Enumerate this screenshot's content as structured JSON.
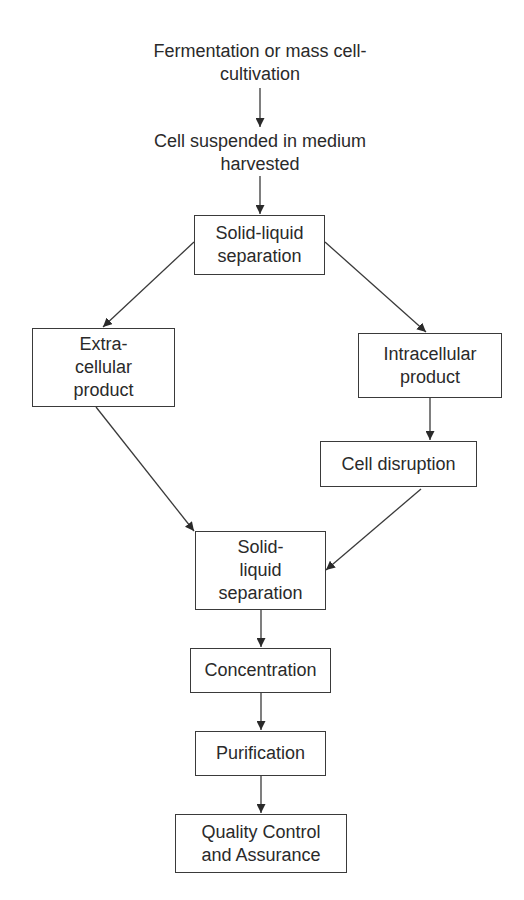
{
  "diagram": {
    "type": "flowchart",
    "nodes": {
      "fermentation": {
        "lines": [
          "Fermentation or mass cell-",
          "cultivation"
        ],
        "shape": "text"
      },
      "harvested": {
        "lines": [
          "Cell suspended in medium",
          "harvested"
        ],
        "shape": "text"
      },
      "sls1": {
        "lines": [
          "Solid-liquid",
          "separation"
        ],
        "shape": "box"
      },
      "extracellular": {
        "lines": [
          "Extra-",
          "cellular",
          "product"
        ],
        "shape": "box"
      },
      "intracellular": {
        "lines": [
          "Intracellular",
          "product"
        ],
        "shape": "box"
      },
      "disruption": {
        "lines": [
          "Cell disruption"
        ],
        "shape": "box"
      },
      "sls2": {
        "lines": [
          "Solid-",
          "liquid",
          "separation"
        ],
        "shape": "box"
      },
      "concentration": {
        "lines": [
          "Concentration"
        ],
        "shape": "box"
      },
      "purification": {
        "lines": [
          "Purification"
        ],
        "shape": "box"
      },
      "qc": {
        "lines": [
          "Quality Control",
          "and Assurance"
        ],
        "shape": "box"
      }
    },
    "edges": [
      {
        "from": "fermentation",
        "to": "harvested"
      },
      {
        "from": "harvested",
        "to": "sls1"
      },
      {
        "from": "sls1",
        "to": "extracellular"
      },
      {
        "from": "sls1",
        "to": "intracellular"
      },
      {
        "from": "intracellular",
        "to": "disruption"
      },
      {
        "from": "extracellular",
        "to": "sls2"
      },
      {
        "from": "disruption",
        "to": "sls2"
      },
      {
        "from": "sls2",
        "to": "concentration"
      },
      {
        "from": "concentration",
        "to": "purification"
      },
      {
        "from": "purification",
        "to": "qc"
      }
    ],
    "colors": {
      "line": "#3a3a3a",
      "text": "#2a2a2a",
      "background": "#ffffff"
    }
  }
}
